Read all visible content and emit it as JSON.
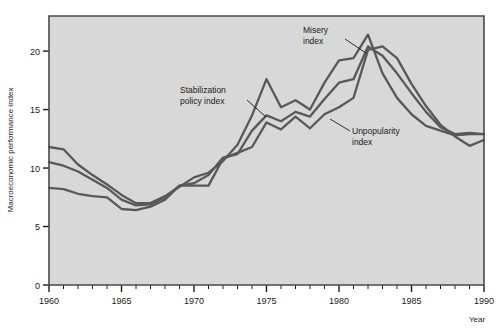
{
  "figure": {
    "background_color": "#ffffff",
    "plot_background_color": "#d8d8d8",
    "border_color": "#4a4a4a",
    "line_color": "#58585a"
  },
  "axes": {
    "ylabel": "Macroeconomic performance index",
    "xlabel": "Year",
    "y_ticks": [
      "0",
      "5",
      "10",
      "15",
      "20"
    ],
    "x_ticks": [
      "1960",
      "1965",
      "1970",
      "1975",
      "1980",
      "1985",
      "1990"
    ]
  },
  "annotations": [
    {
      "id": "stabilization",
      "line1": "Stabilization",
      "line2": "policy index"
    },
    {
      "id": "misery",
      "line1": "Misery",
      "line2": "index"
    },
    {
      "id": "unpopularity",
      "line1": "Unpopularity",
      "line2": "index"
    }
  ],
  "chart_data": {
    "type": "line",
    "title": "",
    "xlabel": "Year",
    "ylabel": "Macroeconomic performance index",
    "xlim": [
      1960,
      1990
    ],
    "ylim": [
      0,
      23
    ],
    "y_ticks": [
      0,
      5,
      10,
      15,
      20
    ],
    "x_ticks": [
      1960,
      1965,
      1970,
      1975,
      1980,
      1985,
      1990
    ],
    "minor_x_tick_interval": 1,
    "grid": false,
    "legend": "annotated-inline",
    "x": [
      1960,
      1961,
      1962,
      1963,
      1964,
      1965,
      1966,
      1967,
      1968,
      1969,
      1970,
      1971,
      1972,
      1973,
      1974,
      1975,
      1976,
      1977,
      1978,
      1979,
      1980,
      1981,
      1982,
      1983,
      1984,
      1985,
      1986,
      1987,
      1988,
      1989,
      1990
    ],
    "series": [
      {
        "name": "Misery index",
        "color": "#58585a",
        "values": [
          11.8,
          11.6,
          10.3,
          9.4,
          8.6,
          7.7,
          7.0,
          7.0,
          7.6,
          8.4,
          9.2,
          9.6,
          10.6,
          12.0,
          14.5,
          17.6,
          15.2,
          15.8,
          15.0,
          17.3,
          19.2,
          19.4,
          21.4,
          18.1,
          16.0,
          14.6,
          13.6,
          13.2,
          12.8,
          12.9,
          12.9
        ]
      },
      {
        "name": "Stabilization policy index",
        "color": "#58585a",
        "values": [
          10.5,
          10.2,
          9.7,
          9.0,
          8.3,
          7.3,
          6.8,
          6.9,
          7.5,
          8.5,
          8.7,
          9.4,
          10.9,
          11.2,
          13.2,
          14.5,
          14.0,
          14.8,
          14.4,
          15.9,
          17.3,
          17.6,
          20.4,
          19.6,
          18.1,
          16.4,
          14.8,
          13.5,
          12.9,
          13.0,
          12.9
        ]
      },
      {
        "name": "Unpopularity index",
        "color": "#58585a",
        "values": [
          8.3,
          8.2,
          7.8,
          7.6,
          7.5,
          6.5,
          6.4,
          6.7,
          7.3,
          8.5,
          8.5,
          8.5,
          10.8,
          11.3,
          11.8,
          13.9,
          13.3,
          14.4,
          13.4,
          14.6,
          15.2,
          16.0,
          20.1,
          20.4,
          19.4,
          17.2,
          15.3,
          13.7,
          12.7,
          11.9,
          12.4
        ]
      }
    ]
  }
}
